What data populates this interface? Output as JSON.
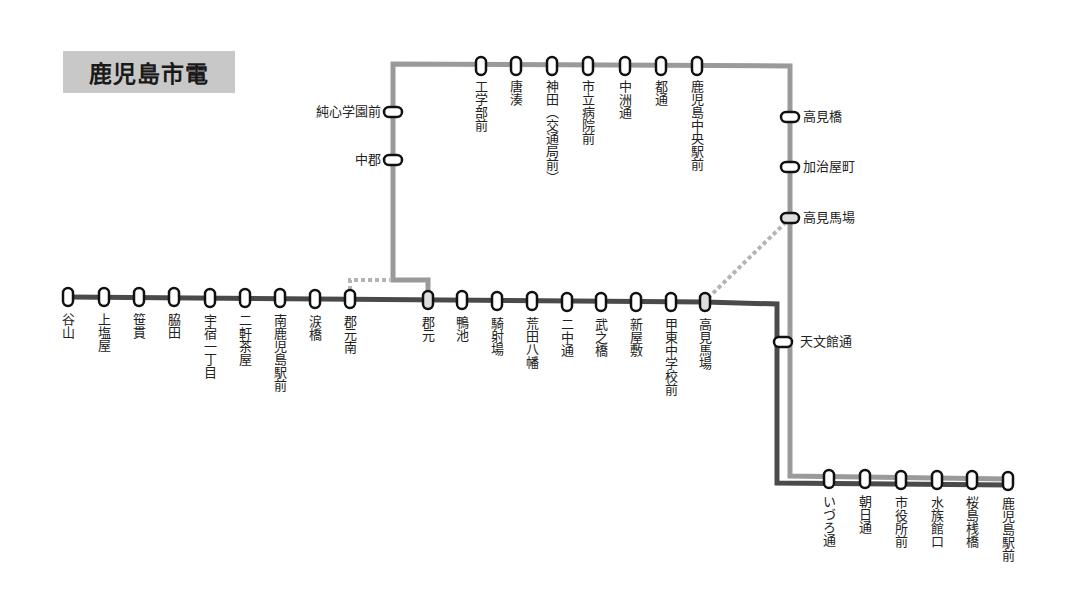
{
  "title": "鹿児島市電",
  "colors": {
    "line1": "#4a4a4a",
    "line2": "#9a9a9a",
    "transfer": "#b4b4b4",
    "title_bg": "#c8c8c8"
  },
  "routes": {
    "main_line": {
      "stations": [
        {
          "name": "谷山",
          "x": 68,
          "y": 297
        },
        {
          "name": "上塩屋",
          "x": 104,
          "y": 297
        },
        {
          "name": "笹貫",
          "x": 139,
          "y": 297
        },
        {
          "name": "脇田",
          "x": 174,
          "y": 297
        },
        {
          "name": "宇宿一丁目",
          "x": 210,
          "y": 298
        },
        {
          "name": "二軒茶屋",
          "x": 245,
          "y": 298
        },
        {
          "name": "南鹿児島駅前",
          "x": 280,
          "y": 298
        },
        {
          "name": "涙橋",
          "x": 315,
          "y": 299
        },
        {
          "name": "郡元南",
          "x": 350,
          "y": 299
        },
        {
          "name": "郡元",
          "x": 428,
          "y": 300
        },
        {
          "name": "鴨池",
          "x": 462,
          "y": 300
        },
        {
          "name": "騎射場",
          "x": 497,
          "y": 301
        },
        {
          "name": "荒田八幡",
          "x": 532,
          "y": 301
        },
        {
          "name": "二中通",
          "x": 567,
          "y": 302
        },
        {
          "name": "武之橋",
          "x": 601,
          "y": 302
        },
        {
          "name": "新屋敷",
          "x": 636,
          "y": 302
        },
        {
          "name": "甲東中学校前",
          "x": 671,
          "y": 302
        },
        {
          "name": "高見馬場",
          "x": 705,
          "y": 302
        }
      ]
    },
    "loop_line": {
      "stations_left": [
        {
          "name": "純心学園前",
          "x": 393,
          "y": 112
        },
        {
          "name": "中郡",
          "x": 393,
          "y": 160
        }
      ],
      "stations_top": [
        {
          "name": "工学部前",
          "x": 481,
          "y": 66
        },
        {
          "name": "唐湊",
          "x": 516,
          "y": 66
        },
        {
          "name": "神田（交通局前）",
          "x": 552,
          "y": 66
        },
        {
          "name": "市立病院前",
          "x": 588,
          "y": 66
        },
        {
          "name": "中洲通",
          "x": 625,
          "y": 66
        },
        {
          "name": "都通",
          "x": 661,
          "y": 66
        },
        {
          "name": "鹿児島中央駅前",
          "x": 697,
          "y": 66
        }
      ],
      "stations_right": [
        {
          "name": "高見橋",
          "x": 790,
          "y": 117
        },
        {
          "name": "加治屋町",
          "x": 790,
          "y": 167
        },
        {
          "name": "高見馬場",
          "x": 790,
          "y": 218
        }
      ]
    },
    "shared": {
      "stations_right": [
        {
          "name": "天文館通",
          "x": 783,
          "y": 342
        }
      ],
      "stations_bottom": [
        {
          "name": "いづろ通",
          "x": 829,
          "y": 479
        },
        {
          "name": "朝日通",
          "x": 865,
          "y": 479
        },
        {
          "name": "市役所前",
          "x": 901,
          "y": 480
        },
        {
          "name": "水族館口",
          "x": 937,
          "y": 480
        },
        {
          "name": "桜島桟橋",
          "x": 972,
          "y": 480
        },
        {
          "name": "鹿児島駅前",
          "x": 1008,
          "y": 481
        }
      ]
    }
  }
}
